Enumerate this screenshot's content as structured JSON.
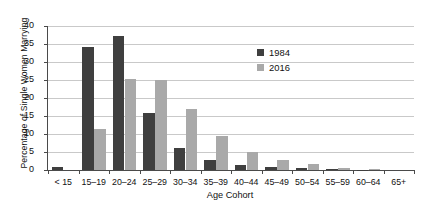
{
  "chart_data": {
    "type": "bar",
    "title": "",
    "xlabel": "Age Cohort",
    "ylabel": "Percentage of Single Women Marrying",
    "ylim": [
      0,
      40
    ],
    "ytick_step": 5,
    "grid": true,
    "legend_position": "upper-right-inside",
    "categories": [
      "< 15",
      "15–19",
      "20–24",
      "25–29",
      "30–34",
      "35–39",
      "40–44",
      "45–49",
      "50–54",
      "55–59",
      "60–64",
      "65+"
    ],
    "series": [
      {
        "name": "1984",
        "color": "#3f3f3f",
        "values": [
          0.7,
          34.1,
          37.1,
          15.7,
          6.0,
          2.7,
          1.5,
          0.9,
          0.5,
          0.2,
          0.1,
          0.0
        ]
      },
      {
        "name": "2016",
        "color": "#a9a9a9",
        "values": [
          0.0,
          11.5,
          25.2,
          25.1,
          17.0,
          9.4,
          5.0,
          2.9,
          1.7,
          0.6,
          0.2,
          0.0
        ]
      }
    ],
    "ytick_labels": [
      "0",
      "5",
      "10",
      "15",
      "20",
      "25",
      "30",
      "35",
      "40"
    ]
  },
  "legend": {
    "entries": [
      {
        "label": "1984"
      },
      {
        "label": "2016"
      }
    ]
  }
}
